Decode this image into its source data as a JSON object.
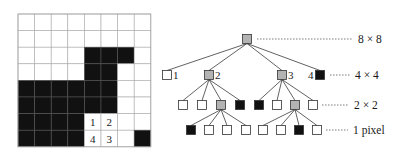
{
  "figure": {
    "colors": {
      "black": "#111111",
      "white": "#ffffff",
      "gray": "#b3b3b3",
      "grid_line": "#a9a9a9",
      "edge": "#3a3a3a",
      "stroke": "#333333"
    }
  },
  "grid": {
    "size": 8,
    "cells": [
      "WWWWWWWW",
      "WWWWWWWW",
      "WWWWBBBW",
      "WWWWBBWW",
      "BBBBBBWW",
      "BBBBBBWW",
      "BBBBWWWW",
      "BBBBWWWB"
    ],
    "cell_labels": [
      {
        "row": 6,
        "col": 4,
        "text": "1"
      },
      {
        "row": 6,
        "col": 5,
        "text": "2"
      },
      {
        "row": 7,
        "col": 5,
        "text": "3"
      },
      {
        "row": 7,
        "col": 4,
        "text": "4"
      }
    ]
  },
  "tree": {
    "levels": [
      {
        "name": "root",
        "label": "8 × 8",
        "nodes": [
          {
            "id": "r",
            "x": 247,
            "fill": "gray"
          }
        ]
      },
      {
        "name": "level1",
        "label": "4 × 4",
        "nodes": [
          {
            "id": "1",
            "x": 167,
            "fill": "white",
            "parent": "r",
            "tag": "1",
            "tag_side": "right"
          },
          {
            "id": "2",
            "x": 209,
            "fill": "gray",
            "parent": "r",
            "tag": "2",
            "tag_side": "right"
          },
          {
            "id": "3",
            "x": 282,
            "fill": "gray",
            "parent": "r",
            "tag": "3",
            "tag_side": "right"
          },
          {
            "id": "4",
            "x": 320,
            "fill": "black",
            "parent": "r",
            "tag": "4",
            "tag_side": "left"
          }
        ]
      },
      {
        "name": "level2",
        "label": "2 × 2",
        "nodes": [
          {
            "id": "2a",
            "x": 183,
            "fill": "white",
            "parent": "2"
          },
          {
            "id": "2b",
            "x": 202,
            "fill": "white",
            "parent": "2"
          },
          {
            "id": "2c",
            "x": 221,
            "fill": "gray",
            "parent": "2"
          },
          {
            "id": "2d",
            "x": 240,
            "fill": "black",
            "parent": "2"
          },
          {
            "id": "3a",
            "x": 259,
            "fill": "black",
            "parent": "3"
          },
          {
            "id": "3b",
            "x": 277,
            "fill": "white",
            "parent": "3"
          },
          {
            "id": "3c",
            "x": 295,
            "fill": "gray",
            "parent": "3"
          },
          {
            "id": "3d",
            "x": 313,
            "fill": "white",
            "parent": "3"
          }
        ]
      },
      {
        "name": "level3",
        "label": "1 pixel",
        "nodes": [
          {
            "id": "2c1",
            "x": 191,
            "fill": "black",
            "parent": "2c"
          },
          {
            "id": "2c2",
            "x": 209,
            "fill": "white",
            "parent": "2c"
          },
          {
            "id": "2c3",
            "x": 227,
            "fill": "white",
            "parent": "2c"
          },
          {
            "id": "2c4",
            "x": 246,
            "fill": "white",
            "parent": "2c"
          },
          {
            "id": "3c1",
            "x": 263,
            "fill": "white",
            "parent": "3c"
          },
          {
            "id": "3c2",
            "x": 281,
            "fill": "white",
            "parent": "3c"
          },
          {
            "id": "3c3",
            "x": 299,
            "fill": "black",
            "parent": "3c"
          },
          {
            "id": "3c4",
            "x": 317,
            "fill": "white",
            "parent": "3c"
          }
        ]
      }
    ],
    "level_y": [
      39,
      75,
      105,
      130
    ],
    "level_label_x": [
      358,
      355,
      354,
      353
    ],
    "level_line_start_x": [
      257,
      330,
      322,
      326
    ],
    "node_size": 9
  }
}
